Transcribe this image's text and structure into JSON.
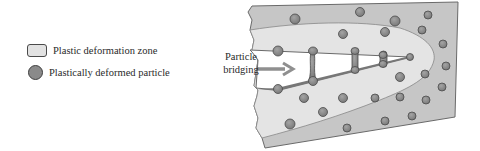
{
  "legend": {
    "items": [
      {
        "label": "Plastic deformation zone",
        "icon": "rounded-rect-swatch",
        "fill": "#e2e2e2"
      },
      {
        "label": "Plastically deformed particle",
        "icon": "circle-swatch",
        "fill": "#8a8a8a"
      }
    ]
  },
  "annotation": {
    "line1": "Particle",
    "line2": "bridging"
  },
  "colors": {
    "matrix": "#c6c6c6",
    "plastic_zone": "#e4e4e4",
    "crack": "#ffffff",
    "particle": "#8a8a8a",
    "particle_stroke": "#4a4a4a",
    "arrow": "#8f8f8f"
  }
}
